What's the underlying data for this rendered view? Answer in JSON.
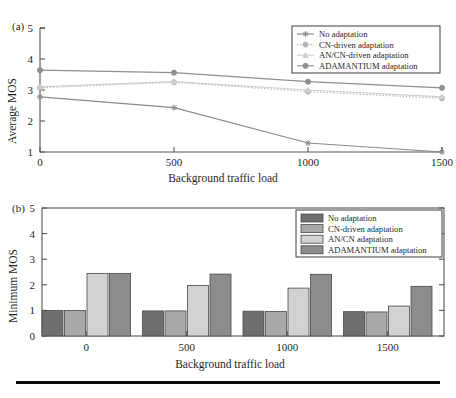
{
  "figure": {
    "background": "#ffffff",
    "rule_color": "#0b0b0b"
  },
  "panel_a": {
    "label": "(a)",
    "xlabel": "Background traffic load",
    "ylabel": "Average MOS"
  },
  "panel_b": {
    "label": "(b)",
    "xlabel": "Background traffic load",
    "ylabel": "Minimum MOS"
  },
  "chart_data": [
    {
      "type": "line",
      "panel": "(a)",
      "title": "",
      "xlabel": "Background traffic load",
      "ylabel": "Average MOS",
      "x": [
        0,
        500,
        1000,
        1500
      ],
      "xticklabels": [
        "0",
        "500",
        "1000",
        "1500"
      ],
      "yticks": [
        1,
        2,
        3,
        4,
        5
      ],
      "yticklabels": [
        "1",
        "2",
        "3",
        "4",
        "5"
      ],
      "xlim": [
        0,
        1500
      ],
      "ylim": [
        1,
        5
      ],
      "grid": false,
      "legend_position": "top-right",
      "series": [
        {
          "name": "No adaptation",
          "values": [
            2.78,
            2.43,
            1.29,
            1.0
          ],
          "color": "#8a8a8a",
          "linestyle": "solid",
          "marker": "star"
        },
        {
          "name": "CN-driven adaptation",
          "values": [
            3.07,
            3.25,
            2.95,
            2.73
          ],
          "color": "#b4b4b4",
          "linestyle": "dotted",
          "marker": "circle"
        },
        {
          "name": "AN/CN-driven adaptation",
          "values": [
            3.1,
            3.27,
            3.0,
            2.78
          ],
          "color": "#cfcfcf",
          "linestyle": "solid",
          "marker": "triangle"
        },
        {
          "name": "ADAMANTIUM adaptation",
          "values": [
            3.64,
            3.56,
            3.27,
            3.07
          ],
          "color": "#8f8f8f",
          "linestyle": "solid",
          "marker": "circle"
        }
      ]
    },
    {
      "type": "bar",
      "panel": "(b)",
      "title": "",
      "xlabel": "Background traffic load",
      "ylabel": "Minimum MOS",
      "categories": [
        "0",
        "500",
        "1000",
        "1500"
      ],
      "yticks": [
        0,
        1,
        2,
        3,
        4,
        5
      ],
      "yticklabels": [
        "0",
        "1",
        "2",
        "3",
        "4",
        "5"
      ],
      "ylim": [
        0,
        5
      ],
      "grid": false,
      "legend_position": "top-right",
      "series": [
        {
          "name": "No adaptation",
          "values": [
            1.0,
            0.98,
            0.97,
            0.95
          ],
          "color": "#6f6f6f"
        },
        {
          "name": "CN-driven adaptation",
          "values": [
            1.0,
            0.98,
            0.96,
            0.94
          ],
          "color": "#a9a9a9"
        },
        {
          "name": "AN/CN adaptation",
          "values": [
            2.44,
            1.97,
            1.87,
            1.17
          ],
          "color": "#d2d2d2"
        },
        {
          "name": "ADAMANTIUM adaptation",
          "values": [
            2.44,
            2.42,
            2.41,
            1.94
          ],
          "color": "#8c8c8c"
        }
      ]
    }
  ]
}
